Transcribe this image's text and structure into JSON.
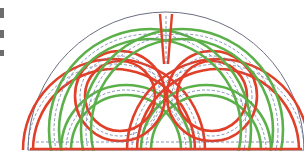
{
  "diagram": {
    "title": "",
    "type": "semicircular-celtic-knot",
    "canvas": {
      "width": 304,
      "height": 164
    },
    "colors": {
      "background": "#ffffff",
      "outline": "#6b6f80",
      "red": "#e0402a",
      "green": "#5cb04a",
      "guide": "#6a7aa6"
    },
    "outline": {
      "cx": 166,
      "cy": 150,
      "r": 138,
      "baseline_y": 150
    },
    "ribbon_width": 10,
    "loops": [
      {
        "name": "left-outer-loop",
        "color": "red",
        "cx": 114,
        "cy": 150,
        "r": 86
      },
      {
        "name": "left-inner-loop",
        "color": "green",
        "cx": 126,
        "cy": 150,
        "r": 60
      },
      {
        "name": "right-outer-loop",
        "color": "red",
        "cx": 218,
        "cy": 150,
        "r": 86
      },
      {
        "name": "right-inner-loop",
        "color": "green",
        "cx": 206,
        "cy": 150,
        "r": 60
      },
      {
        "name": "left-small-loop",
        "color": "red",
        "cx": 120,
        "cy": 96,
        "r": 40
      },
      {
        "name": "right-small-loop",
        "color": "red",
        "cx": 212,
        "cy": 96,
        "r": 40
      },
      {
        "name": "left-green-arc",
        "color": "green",
        "cx": 150,
        "cy": 130,
        "r": 96
      },
      {
        "name": "right-green-arc",
        "color": "green",
        "cx": 182,
        "cy": 130,
        "r": 96
      }
    ],
    "central_spike": {
      "color": "red",
      "x": 166,
      "y_top": 10,
      "y_bottom": 64
    },
    "edge_marks": [
      {
        "top": 6,
        "height": 10
      },
      {
        "top": 28,
        "height": 8
      },
      {
        "top": 48,
        "height": 6
      }
    ]
  }
}
